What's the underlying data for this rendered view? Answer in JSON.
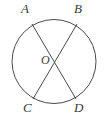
{
  "figure": {
    "kind": "geometry-diagram",
    "width": 105,
    "height": 117,
    "background_color": "#ffffff",
    "stroke_color": "#4a4a4a",
    "label_color": "#3a3a3a",
    "stroke_width": 1
  },
  "circle": {
    "name": "circle",
    "center_x": 54,
    "center_y": 61.5,
    "radius": 42
  },
  "points": [
    {
      "id": "A",
      "label": "A",
      "x": 32,
      "y": 24,
      "label_x": 21,
      "label_y": 2
    },
    {
      "id": "B",
      "label": "B",
      "x": 77,
      "y": 24,
      "label_x": 74,
      "label_y": 2
    },
    {
      "id": "C",
      "label": "C",
      "x": 33,
      "y": 99,
      "label_x": 23,
      "label_y": 101
    },
    {
      "id": "D",
      "label": "D",
      "x": 76,
      "y": 99,
      "label_x": 74,
      "label_y": 101
    },
    {
      "id": "O",
      "label": "O",
      "x": 54,
      "y": 61.5,
      "label_x": 41,
      "label_y": 54
    }
  ],
  "chords": [
    {
      "id": "AD",
      "from": "A",
      "to": "D",
      "x1": 32,
      "y1": 24,
      "x2": 76,
      "y2": 99
    },
    {
      "id": "BC",
      "from": "B",
      "to": "C",
      "x1": 77,
      "y1": 24,
      "x2": 33,
      "y2": 99
    }
  ]
}
